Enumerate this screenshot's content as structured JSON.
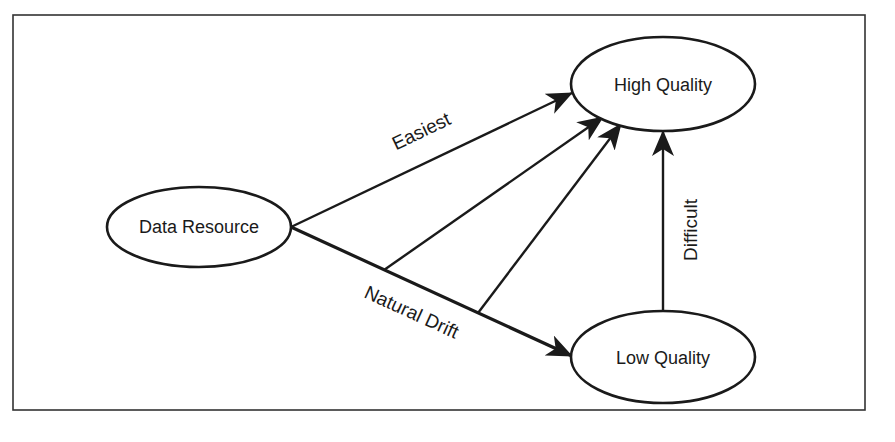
{
  "diagram": {
    "type": "flow-diagram",
    "frame": {
      "x": 13,
      "y": 15,
      "width": 852,
      "height": 395,
      "stroke": "#333333"
    },
    "colors": {
      "ink": "#1a1a1a",
      "background": "#ffffff"
    },
    "nodes": [
      {
        "id": "data-resource",
        "label": "Data Resource",
        "cx": 199,
        "cy": 227,
        "rx": 92,
        "ry": 40
      },
      {
        "id": "high-quality",
        "label": "High Quality",
        "cx": 663,
        "cy": 84,
        "rx": 92,
        "ry": 47
      },
      {
        "id": "low-quality",
        "label": "Low Quality",
        "cx": 663,
        "cy": 357,
        "rx": 92,
        "ry": 46
      }
    ],
    "edges": [
      {
        "id": "easiest",
        "from": "data-resource",
        "to": "high-quality",
        "label": "Easiest"
      },
      {
        "id": "natural-drift",
        "from": "data-resource",
        "to": "low-quality",
        "label": "Natural Drift"
      },
      {
        "id": "drift-branch-1",
        "from": "natural-drift",
        "to": "high-quality",
        "label": ""
      },
      {
        "id": "drift-branch-2",
        "from": "natural-drift",
        "to": "high-quality",
        "label": ""
      },
      {
        "id": "difficult",
        "from": "low-quality",
        "to": "high-quality",
        "label": "Difficult"
      }
    ],
    "labels": {
      "easiest": "Easiest",
      "natural_drift": "Natural Drift",
      "difficult": "Difficult"
    }
  }
}
